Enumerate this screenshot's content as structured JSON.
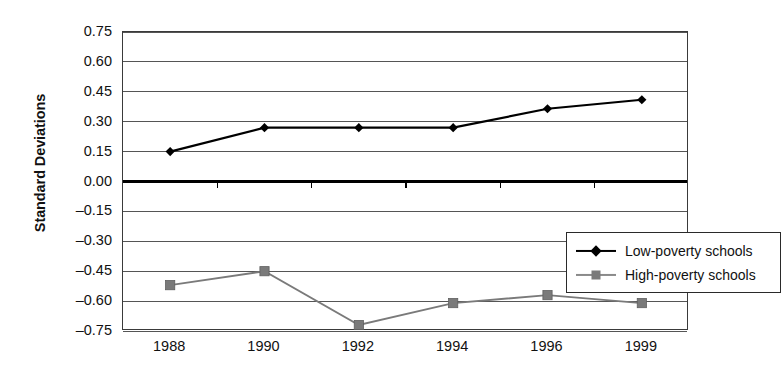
{
  "chart_data": {
    "type": "line",
    "title": "",
    "xlabel": "",
    "ylabel": "Standard Deviations",
    "categories": [
      "1988",
      "1990",
      "1992",
      "1994",
      "1996",
      "1999"
    ],
    "ylim": [
      -0.75,
      0.75
    ],
    "yticks": [
      "0.75",
      "0.60",
      "0.45",
      "0.30",
      "0.15",
      "0.00",
      "–0.15",
      "–0.30",
      "–0.45",
      "–0.60",
      "–0.75"
    ],
    "ytick_values": [
      0.75,
      0.6,
      0.45,
      0.3,
      0.15,
      0.0,
      -0.15,
      -0.3,
      -0.45,
      -0.6,
      -0.75
    ],
    "grid": true,
    "legend_position": "inside-center-right",
    "zero_line": 0.0,
    "series": [
      {
        "name": "Low-poverty schools",
        "values": [
          0.15,
          0.27,
          0.27,
          0.27,
          0.365,
          0.41
        ],
        "color": "#000000",
        "marker": "diamond"
      },
      {
        "name": "High-poverty schools",
        "values": [
          -0.52,
          -0.45,
          -0.72,
          -0.61,
          -0.57,
          -0.61
        ],
        "color": "#7a7a7a",
        "marker": "square"
      }
    ]
  },
  "legend": {
    "items": [
      {
        "label": "Low-poverty schools",
        "marker": "diamond-marker-icon",
        "color": "#000000"
      },
      {
        "label": "High-poverty schools",
        "marker": "square-marker-icon",
        "color": "#7a7a7a"
      }
    ]
  }
}
